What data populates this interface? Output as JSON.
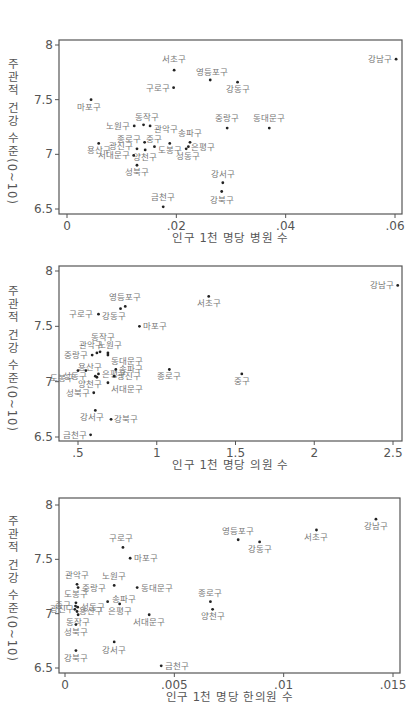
{
  "chart_data": [
    {
      "type": "scatter",
      "title": "",
      "xlabel": "인구 1천 명당 병원 수",
      "ylabel": "주관적 건강 수준(0~10)",
      "xlim": [
        -0.0018,
        0.0613
      ],
      "ylim": [
        6.46,
        8.05
      ],
      "xticks": [
        0,
        0.02,
        0.04,
        0.06
      ],
      "xtick_labels": [
        "0",
        ".02",
        ".04",
        ".06"
      ],
      "yticks": [
        6.5,
        7,
        7.5,
        8
      ],
      "ytick_labels": [
        "6.5",
        "7",
        "7.5",
        "8"
      ],
      "grid": false,
      "legend": null,
      "points": [
        {
          "label": "강남구",
          "x": 0.0602,
          "y": 7.87,
          "lx": -4,
          "ly": 3,
          "anchor": "end"
        },
        {
          "label": "서초구",
          "x": 0.0196,
          "y": 7.77,
          "lx": 0,
          "ly": -8,
          "anchor": "middle"
        },
        {
          "label": "영등포구",
          "x": 0.0262,
          "y": 7.68,
          "lx": 2,
          "ly": -5,
          "anchor": "middle"
        },
        {
          "label": "강동구",
          "x": 0.0312,
          "y": 7.66,
          "lx": 0,
          "ly": 10,
          "anchor": "middle"
        },
        {
          "label": "구로구",
          "x": 0.0195,
          "y": 7.61,
          "lx": -4,
          "ly": 3,
          "anchor": "end"
        },
        {
          "label": "마포구",
          "x": 0.0044,
          "y": 7.5,
          "lx": -2,
          "ly": 10,
          "anchor": "middle"
        },
        {
          "label": "노원구",
          "x": 0.0123,
          "y": 7.26,
          "lx": -4,
          "ly": 3,
          "anchor": "end"
        },
        {
          "label": "동작구",
          "x": 0.014,
          "y": 7.27,
          "lx": 3,
          "ly": -5,
          "anchor": "middle"
        },
        {
          "label": "관악구",
          "x": 0.0152,
          "y": 7.26,
          "lx": 4,
          "ly": 6,
          "anchor": "start"
        },
        {
          "label": "중랑구",
          "x": 0.0293,
          "y": 7.24,
          "lx": 0,
          "ly": -7,
          "anchor": "middle"
        },
        {
          "label": "동대문구",
          "x": 0.037,
          "y": 7.24,
          "lx": 0,
          "ly": -7,
          "anchor": "middle"
        },
        {
          "label": "종로구",
          "x": 0.0142,
          "y": 7.11,
          "lx": -4,
          "ly": 0,
          "anchor": "end"
        },
        {
          "label": "중구",
          "x": 0.016,
          "y": 7.07,
          "lx": 0,
          "ly": -5,
          "anchor": "middle"
        },
        {
          "label": "송파구",
          "x": 0.0225,
          "y": 7.11,
          "lx": 0,
          "ly": -6,
          "anchor": "middle"
        },
        {
          "label": "용산구",
          "x": 0.0058,
          "y": 7.1,
          "lx": 0,
          "ly": 10,
          "anchor": "middle"
        },
        {
          "label": "도봉구",
          "x": 0.0188,
          "y": 7.1,
          "lx": 0,
          "ly": 10,
          "anchor": "middle"
        },
        {
          "label": "은평구",
          "x": 0.0222,
          "y": 7.07,
          "lx": 3,
          "ly": 3,
          "anchor": "start"
        },
        {
          "label": "광진구",
          "x": 0.0128,
          "y": 7.05,
          "lx": -4,
          "ly": 0,
          "anchor": "end"
        },
        {
          "label": "양천구",
          "x": 0.0143,
          "y": 7.04,
          "lx": 0,
          "ly": 10,
          "anchor": "middle"
        },
        {
          "label": "성동구",
          "x": 0.0218,
          "y": 7.05,
          "lx": 2,
          "ly": 10,
          "anchor": "middle"
        },
        {
          "label": "서대문구",
          "x": 0.0122,
          "y": 6.99,
          "lx": -4,
          "ly": 3,
          "anchor": "end"
        },
        {
          "label": "성북구",
          "x": 0.0128,
          "y": 6.9,
          "lx": 0,
          "ly": 10,
          "anchor": "middle"
        },
        {
          "label": "강서구",
          "x": 0.0285,
          "y": 6.74,
          "lx": 0,
          "ly": -6,
          "anchor": "middle"
        },
        {
          "label": "강북구",
          "x": 0.0283,
          "y": 6.66,
          "lx": 0,
          "ly": 11,
          "anchor": "middle"
        },
        {
          "label": "금천구",
          "x": 0.0176,
          "y": 6.52,
          "lx": 0,
          "ly": -7,
          "anchor": "middle"
        }
      ]
    },
    {
      "type": "scatter",
      "title": "",
      "xlabel": "인구 1천 명당 의원 수",
      "ylabel": "주관적 건강 수준(0~10)",
      "xlim": [
        0.39,
        2.555
      ],
      "ylim": [
        6.46,
        8.05
      ],
      "xticks": [
        0.5,
        1,
        1.5,
        2,
        2.5
      ],
      "xtick_labels": [
        ".5",
        "1",
        "1.5",
        "2",
        "2.5"
      ],
      "yticks": [
        6.5,
        7,
        7.5,
        8
      ],
      "ytick_labels": [
        "6.5",
        "7",
        "7.5",
        "8"
      ],
      "grid": false,
      "legend": null,
      "points": [
        {
          "label": "강남구",
          "x": 2.53,
          "y": 7.87,
          "lx": -4,
          "ly": 3,
          "anchor": "end"
        },
        {
          "label": "서초구",
          "x": 1.33,
          "y": 7.77,
          "lx": 0,
          "ly": 10,
          "anchor": "middle"
        },
        {
          "label": "영등포구",
          "x": 0.8,
          "y": 7.68,
          "lx": 0,
          "ly": -6,
          "anchor": "middle"
        },
        {
          "label": "강동구",
          "x": 0.77,
          "y": 7.66,
          "lx": -7,
          "ly": 10,
          "anchor": "middle"
        },
        {
          "label": "구로구",
          "x": 0.63,
          "y": 7.61,
          "lx": -5,
          "ly": 3,
          "anchor": "end"
        },
        {
          "label": "마포구",
          "x": 0.89,
          "y": 7.5,
          "lx": 4,
          "ly": 3,
          "anchor": "start"
        },
        {
          "label": "노원구",
          "x": 0.69,
          "y": 7.26,
          "lx": 2,
          "ly": -5,
          "anchor": "middle"
        },
        {
          "label": "동작구",
          "x": 0.64,
          "y": 7.27,
          "lx": 3,
          "ly": -12,
          "anchor": "middle"
        },
        {
          "label": "관악구",
          "x": 0.62,
          "y": 7.26,
          "lx": -6,
          "ly": -5,
          "anchor": "middle"
        },
        {
          "label": "중랑구",
          "x": 0.59,
          "y": 7.24,
          "lx": -4,
          "ly": 3,
          "anchor": "end"
        },
        {
          "label": "동대문구",
          "x": 0.69,
          "y": 7.24,
          "lx": 3,
          "ly": 9,
          "anchor": "start"
        },
        {
          "label": "종로구",
          "x": 1.08,
          "y": 7.11,
          "lx": 0,
          "ly": 10,
          "anchor": "middle"
        },
        {
          "label": "중구",
          "x": 1.54,
          "y": 7.07,
          "lx": 0,
          "ly": 10,
          "anchor": "middle"
        },
        {
          "label": "송파구",
          "x": 0.74,
          "y": 7.11,
          "lx": 3,
          "ly": 3,
          "anchor": "start"
        },
        {
          "label": "용산구",
          "x": 0.55,
          "y": 7.1,
          "lx": 4,
          "ly": -1,
          "anchor": "middle"
        },
        {
          "label": "도봉구",
          "x": 0.5,
          "y": 7.1,
          "lx": -4,
          "ly": 10,
          "anchor": "end"
        },
        {
          "label": "은평구",
          "x": 0.63,
          "y": 7.07,
          "lx": 4,
          "ly": 3,
          "anchor": "start"
        },
        {
          "label": "광진구",
          "x": 0.73,
          "y": 7.05,
          "lx": 3,
          "ly": 3,
          "anchor": "start"
        },
        {
          "label": "양천구",
          "x": 0.62,
          "y": 7.04,
          "lx": -7,
          "ly": 10,
          "anchor": "middle"
        },
        {
          "label": "성동구",
          "x": 0.61,
          "y": 7.05,
          "lx": -8,
          "ly": 3,
          "anchor": "end"
        },
        {
          "label": "서대문구",
          "x": 0.69,
          "y": 6.99,
          "lx": 3,
          "ly": 9,
          "anchor": "start"
        },
        {
          "label": "성북구",
          "x": 0.6,
          "y": 6.9,
          "lx": -4,
          "ly": 3,
          "anchor": "end"
        },
        {
          "label": "강서구",
          "x": 0.61,
          "y": 6.74,
          "lx": -3,
          "ly": 10,
          "anchor": "middle"
        },
        {
          "label": "강북구",
          "x": 0.71,
          "y": 6.66,
          "lx": 3,
          "ly": 3,
          "anchor": "start"
        },
        {
          "label": "금천구",
          "x": 0.58,
          "y": 6.52,
          "lx": -4,
          "ly": 3,
          "anchor": "end"
        }
      ]
    },
    {
      "type": "scatter",
      "title": "",
      "xlabel": "인구 1천 명당 한의원 수",
      "ylabel": "주관적 건강 수준(0~10)",
      "xlim": [
        -0.00027,
        0.01535
      ],
      "ylim": [
        6.46,
        8.05
      ],
      "xticks": [
        0,
        0.005,
        0.01,
        0.015
      ],
      "xtick_labels": [
        "0",
        ".005",
        ".01",
        ".015"
      ],
      "yticks": [
        6.5,
        7,
        7.5,
        8
      ],
      "ytick_labels": [
        "6.5",
        "7",
        "7.5",
        "8"
      ],
      "grid": false,
      "legend": null,
      "points": [
        {
          "label": "강남구",
          "x": 0.01422,
          "y": 7.87,
          "lx": 0,
          "ly": 10,
          "anchor": "middle"
        },
        {
          "label": "서초구",
          "x": 0.0115,
          "y": 7.77,
          "lx": 0,
          "ly": 10,
          "anchor": "middle"
        },
        {
          "label": "영등포구",
          "x": 0.00792,
          "y": 7.68,
          "lx": 0,
          "ly": -6,
          "anchor": "middle"
        },
        {
          "label": "강동구",
          "x": 0.0089,
          "y": 7.66,
          "lx": 0,
          "ly": 10,
          "anchor": "middle"
        },
        {
          "label": "구로구",
          "x": 0.00265,
          "y": 7.61,
          "lx": -2,
          "ly": -6,
          "anchor": "middle"
        },
        {
          "label": "마포구",
          "x": 0.00298,
          "y": 7.51,
          "lx": 4,
          "ly": 3,
          "anchor": "start"
        },
        {
          "label": "노원구",
          "x": 0.00225,
          "y": 7.26,
          "lx": 0,
          "ly": -6,
          "anchor": "middle"
        },
        {
          "label": "동작구",
          "x": 0.0006,
          "y": 6.99,
          "lx": 0,
          "ly": 10,
          "anchor": "middle"
        },
        {
          "label": "관악구",
          "x": 0.00055,
          "y": 7.27,
          "lx": 0,
          "ly": -6,
          "anchor": "middle"
        },
        {
          "label": "중랑구",
          "x": 0.0006,
          "y": 7.24,
          "lx": 4,
          "ly": 3,
          "anchor": "start"
        },
        {
          "label": "동대문구",
          "x": 0.0033,
          "y": 7.24,
          "lx": 4,
          "ly": 3,
          "anchor": "start"
        },
        {
          "label": "종로구",
          "x": 0.00665,
          "y": 7.11,
          "lx": 0,
          "ly": -6,
          "anchor": "middle"
        },
        {
          "label": "중구",
          "x": 0.00048,
          "y": 7.07,
          "lx": -4,
          "ly": 2,
          "anchor": "end"
        },
        {
          "label": "송파구",
          "x": 0.00195,
          "y": 7.11,
          "lx": 4,
          "ly": 0,
          "anchor": "start"
        },
        {
          "label": "용산구",
          "x": 0.00055,
          "y": 7.02,
          "lx": 2,
          "ly": 3,
          "anchor": "start"
        },
        {
          "label": "도봉구",
          "x": 0.0005,
          "y": 7.1,
          "lx": 0,
          "ly": -6,
          "anchor": "middle"
        },
        {
          "label": "은평구",
          "x": 0.0025,
          "y": 7.09,
          "lx": 0,
          "ly": 10,
          "anchor": "middle"
        },
        {
          "label": "광진구",
          "x": 0.00045,
          "y": 7.04,
          "lx": -1,
          "ly": 3,
          "anchor": "end"
        },
        {
          "label": "양천구",
          "x": 0.00675,
          "y": 7.04,
          "lx": 0,
          "ly": 10,
          "anchor": "middle"
        },
        {
          "label": "성동구",
          "x": 0.00058,
          "y": 7.06,
          "lx": 3,
          "ly": 3,
          "anchor": "start"
        },
        {
          "label": "서대문구",
          "x": 0.00385,
          "y": 6.99,
          "lx": 0,
          "ly": 10,
          "anchor": "middle"
        },
        {
          "label": "성북구",
          "x": 0.0005,
          "y": 6.9,
          "lx": 0,
          "ly": 10,
          "anchor": "middle"
        },
        {
          "label": "강서구",
          "x": 0.00225,
          "y": 6.74,
          "lx": 0,
          "ly": 11,
          "anchor": "middle"
        },
        {
          "label": "강북구",
          "x": 0.0005,
          "y": 6.66,
          "lx": 0,
          "ly": 10,
          "anchor": "middle"
        },
        {
          "label": "금천구",
          "x": 0.0044,
          "y": 6.52,
          "lx": 4,
          "ly": 3,
          "anchor": "start"
        }
      ]
    }
  ],
  "layout": [
    {
      "top": 0,
      "plot": {
        "x0": 59,
        "y0": 40,
        "x1": 402,
        "y1": 214
      },
      "px": {
        "xa": 67,
        "xb": 395,
        "va": 0,
        "vb": 0.06,
        "ya": 209,
        "yb": 45,
        "wa": 6.5,
        "wb": 8
      }
    },
    {
      "top": 0,
      "plot": {
        "x0": 59,
        "y0": 266,
        "x1": 402,
        "y1": 441
      },
      "px": {
        "xa": 78,
        "xb": 393,
        "va": 0.5,
        "vb": 2.5,
        "ya": 437,
        "yb": 271,
        "wa": 6.5,
        "wb": 8
      }
    },
    {
      "top": 0,
      "plot": {
        "x0": 59,
        "y0": 498,
        "x1": 400,
        "y1": 673
      },
      "px": {
        "xa": 65,
        "xb": 393,
        "va": 0,
        "vb": 0.015,
        "ya": 668,
        "yb": 505,
        "wa": 6.5,
        "wb": 8
      }
    }
  ],
  "charts_text": {
    "c0": {
      "xlabel": "인구 1천 명당 병원 수",
      "ylabel": "주관적 건강 수준(0~10)"
    },
    "c1": {
      "xlabel": "인구 1천 명당 의원 수",
      "ylabel": "주관적 건강 수준(0~10)"
    },
    "c2": {
      "xlabel": "인구 1천 명당 한의원 수",
      "ylabel": "주관적 건강 수준(0~10)"
    }
  }
}
